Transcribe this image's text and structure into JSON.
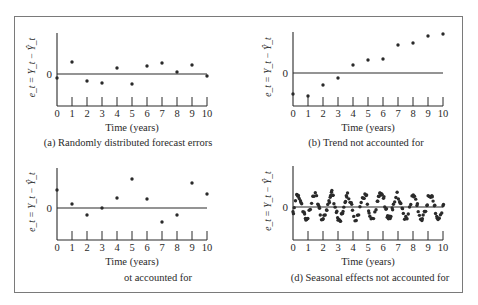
{
  "figure": {
    "frame_color": "#7a7a7a",
    "ink_color": "#2a2a2a",
    "y_axis_label": "e_t = Y_t − Ŷ_t",
    "y_zero_label": "0",
    "x_axis_label": "Time (years)",
    "x_tick_labels": [
      "0",
      "1",
      "2",
      "3",
      "4",
      "5",
      "6",
      "7",
      "8",
      "9",
      "10"
    ]
  },
  "chart_data": [
    {
      "type": "scatter",
      "id": "a",
      "title": "(a) Randomly distributed forecast errors",
      "xlabel": "Time (years)",
      "ylabel": "e_t = Y_t − Ŷ_t",
      "x": [
        0,
        1,
        2,
        3,
        4,
        5,
        6,
        7,
        8,
        9,
        10
      ],
      "y": [
        -4,
        12,
        -7,
        -9,
        6,
        -10,
        8,
        11,
        2,
        9,
        -2
      ],
      "xlim": [
        0,
        10
      ],
      "ylim": [
        -32,
        41
      ],
      "zero_line": true
    },
    {
      "type": "scatter",
      "id": "b",
      "title": "(b) Trend not accounted for",
      "xlabel": "Time (years)",
      "ylabel": "e_t = Y_t − Ŷ_t",
      "x": [
        0,
        1,
        2,
        3,
        4,
        5,
        6,
        7,
        8,
        9,
        10
      ],
      "y": [
        -21,
        -23,
        -12,
        -5,
        8,
        13,
        14,
        28,
        30,
        37,
        39
      ],
      "xlim": [
        0,
        10
      ],
      "ylim": [
        -33,
        40
      ],
      "zero_line": true
    },
    {
      "type": "scatter",
      "id": "c",
      "title": "ot accounted for",
      "xlabel": "Time (years)",
      "ylabel": "e_t = Y_t − Ŷ_t",
      "x": [
        0,
        1,
        2,
        3,
        4,
        5,
        6,
        7,
        8,
        9,
        10
      ],
      "y": [
        18,
        4,
        -7,
        0,
        10,
        29,
        9,
        -14,
        -7,
        25,
        14
      ],
      "xlim": [
        0,
        10
      ],
      "ylim": [
        -32,
        40
      ],
      "zero_line": true
    },
    {
      "type": "scatter",
      "id": "d",
      "title": "(d) Seasonal effects not accounted for",
      "xlabel": "Time (years)",
      "ylabel": "e_t = Y_t − Ŷ_t",
      "pattern": "seasonal sinusoid, about 9 cycles over 10 years, amplitude about 12, roughly 12 observations per cycle",
      "x_start": 0,
      "x_end": 10,
      "points_per_year": 11,
      "amplitude": 12,
      "period_years": 1.1,
      "xlim": [
        0,
        10
      ],
      "ylim": [
        -33,
        39
      ],
      "zero_line": true
    }
  ]
}
